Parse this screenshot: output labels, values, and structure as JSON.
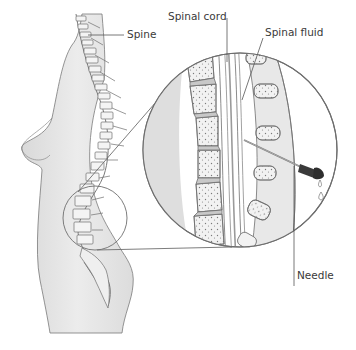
{
  "diagram": {
    "title": "",
    "labels": {
      "spine": "Spine",
      "spinal_cord": "Spinal cord",
      "spinal_fluid": "Spinal fluid",
      "needle": "Needle"
    },
    "colors": {
      "background": "#ffffff",
      "skin": "#e6e6e6",
      "skin_shade": "#d2d2d2",
      "outline": "#6e6e6e",
      "bone": "#f2f2f2",
      "bone_texture": "#7a7a7a",
      "disc": "#c8c8c8",
      "spinal_cord": "#bdbdbd",
      "text": "#3a3a3a",
      "leader_line": "#555555",
      "needle_hub": "#2e2e2e"
    },
    "elements": [
      "torso-side-view",
      "spine-column",
      "magnify-circle-small",
      "magnify-circle-large",
      "magnified-vertebrae",
      "spinal-canal",
      "needle",
      "fluid-drops"
    ]
  }
}
